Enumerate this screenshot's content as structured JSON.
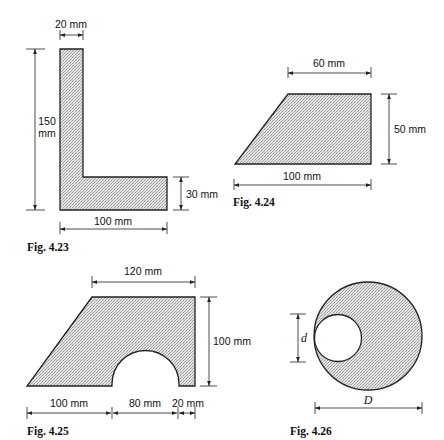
{
  "figures": [
    {
      "id": "fig-4-23",
      "caption": "Fig. 4.23",
      "shape": "L-section",
      "dimensions": {
        "top_width": "20 mm",
        "height_line1": "150",
        "height_line2": "mm",
        "flange_thickness": "30 mm",
        "base_width": "100 mm"
      }
    },
    {
      "id": "fig-4-24",
      "caption": "Fig. 4.24",
      "shape": "trapezoid",
      "dimensions": {
        "top_width": "60 mm",
        "height": "50 mm",
        "base_width": "100 mm"
      }
    },
    {
      "id": "fig-4-25",
      "caption": "Fig. 4.25",
      "shape": "trapezoid-with-semicircular-cutout",
      "dimensions": {
        "top_width": "120 mm",
        "height": "100 mm",
        "base_left": "100 mm",
        "base_cutout": "80 mm",
        "base_right": "20 mm"
      }
    },
    {
      "id": "fig-4-26",
      "caption": "Fig. 4.26",
      "shape": "circle-with-eccentric-hole",
      "dimensions": {
        "hole_diameter": "d",
        "outer_diameter": "D"
      }
    }
  ],
  "colors": {
    "outline": "#222222",
    "hatch": "#9a9a9a",
    "fill_base": "#e4e4e4",
    "background": "#ffffff"
  }
}
